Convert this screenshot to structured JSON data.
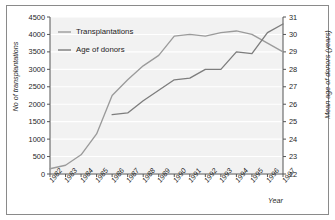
{
  "chart_data": {
    "type": "line",
    "title": "",
    "xlabel": "Year",
    "ylabel": "No of transplantations",
    "y2label": "Mean age of donors (years)",
    "grid": true,
    "legend_position": "top-left",
    "x": [
      1982,
      1983,
      1984,
      1985,
      1986,
      1987,
      1988,
      1989,
      1990,
      1991,
      1992,
      1993,
      1994,
      1995,
      1996,
      1997
    ],
    "xtick_labels": [
      "1982",
      "1983",
      "1984",
      "1985",
      "1986",
      "1987",
      "1988",
      "1989",
      "1990",
      "1991",
      "1992",
      "1993",
      "1994",
      "1995",
      "1996",
      "1997"
    ],
    "ylim": [
      0,
      4500
    ],
    "ytick_labels": [
      "0",
      "500",
      "1000",
      "1500",
      "2000",
      "2500",
      "3000",
      "3500",
      "4000",
      "4500"
    ],
    "ytick_values": [
      0,
      500,
      1000,
      1500,
      2000,
      2500,
      3000,
      3500,
      4000,
      4500
    ],
    "y2lim": [
      22,
      31
    ],
    "y2tick_labels": [
      "22",
      "23",
      "24",
      "25",
      "26",
      "27",
      "28",
      "29",
      "30",
      "31"
    ],
    "y2tick_values": [
      22,
      23,
      24,
      25,
      26,
      27,
      28,
      29,
      30,
      31
    ],
    "series": [
      {
        "name": "Transplantations",
        "axis": "left",
        "color": "#9b9b9b",
        "x": [
          1982,
          1983,
          1984,
          1985,
          1986,
          1987,
          1988,
          1989,
          1990,
          1991,
          1992,
          1993,
          1994,
          1995,
          1996,
          1997
        ],
        "values": [
          150,
          250,
          550,
          1150,
          2250,
          2700,
          3100,
          3400,
          3950,
          4000,
          3950,
          4050,
          4100,
          4000,
          3750,
          3500
        ]
      },
      {
        "name": "Age of donors",
        "axis": "right",
        "color": "#7d7d7d",
        "x": [
          1986,
          1987,
          1988,
          1989,
          1990,
          1991,
          1992,
          1993,
          1994,
          1995,
          1996,
          1997
        ],
        "values": [
          25.4,
          25.5,
          26.2,
          26.8,
          27.4,
          27.5,
          28.0,
          28.0,
          29.0,
          28.9,
          30.1,
          30.6
        ]
      }
    ]
  },
  "legend": {
    "items": [
      {
        "label": "Transplantations"
      },
      {
        "label": "Age of donors"
      }
    ]
  },
  "axes": {
    "left_title": "No of transplantations",
    "right_title": "Mean age of donors (years)",
    "x_title": "Year"
  }
}
